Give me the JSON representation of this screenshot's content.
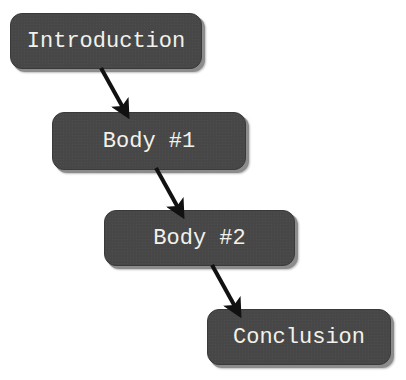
{
  "diagram": {
    "type": "flowchart",
    "direction": "top-left to bottom-right",
    "nodes": [
      {
        "id": "intro",
        "label": "Introduction"
      },
      {
        "id": "body1",
        "label": "Body #1"
      },
      {
        "id": "body2",
        "label": "Body #2"
      },
      {
        "id": "conclusion",
        "label": "Conclusion"
      }
    ],
    "edges": [
      {
        "from": "intro",
        "to": "body1"
      },
      {
        "from": "body1",
        "to": "body2"
      },
      {
        "from": "body2",
        "to": "conclusion"
      }
    ],
    "colors": {
      "node_fill": "#474747",
      "node_text": "#f2f2ec",
      "node_shadow": "#8c8c8c",
      "arrow": "#111111",
      "background": "#ffffff"
    }
  }
}
